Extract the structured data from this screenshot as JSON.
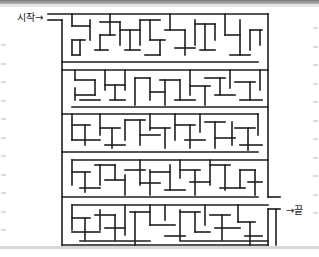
{
  "puzzle": {
    "type": "maze",
    "start_label": "시작→",
    "end_label": "→끝",
    "wall_color": "#1e1e1e",
    "background_color": "#ffffff"
  }
}
